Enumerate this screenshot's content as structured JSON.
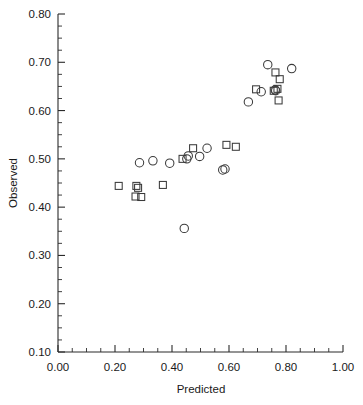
{
  "chart_data": {
    "type": "scatter",
    "title": "",
    "xlabel": "Predicted",
    "ylabel": "Observed",
    "xlim": [
      0.0,
      1.0
    ],
    "ylim": [
      0.1,
      0.8
    ],
    "grid": false,
    "legend": "none",
    "xticks": [
      0.0,
      0.2,
      0.4,
      0.6,
      0.8,
      1.0
    ],
    "xtick_labels": [
      "0.00",
      "0.20",
      "0.40",
      "0.60",
      "0.80",
      "1.00"
    ],
    "yticks": [
      0.1,
      0.2,
      0.3,
      0.4,
      0.5,
      0.6,
      0.7,
      0.8
    ],
    "ytick_labels": [
      "0.10",
      "0.20",
      "0.30",
      "0.40",
      "0.50",
      "0.60",
      "0.70",
      "0.80"
    ],
    "x_minor_tick_step": 0.05,
    "y_minor_tick_step": 0.025,
    "series": [
      {
        "name": "circles",
        "marker": "circle",
        "color": "#3a3a3a",
        "points": [
          [
            0.286,
            0.492
          ],
          [
            0.333,
            0.496
          ],
          [
            0.392,
            0.491
          ],
          [
            0.443,
            0.356
          ],
          [
            0.452,
            0.5
          ],
          [
            0.457,
            0.506
          ],
          [
            0.497,
            0.505
          ],
          [
            0.523,
            0.522
          ],
          [
            0.578,
            0.477
          ],
          [
            0.586,
            0.479
          ],
          [
            0.668,
            0.618
          ],
          [
            0.713,
            0.639
          ],
          [
            0.736,
            0.695
          ],
          [
            0.762,
            0.643
          ],
          [
            0.764,
            0.641
          ],
          [
            0.82,
            0.687
          ]
        ]
      },
      {
        "name": "squares",
        "marker": "square",
        "color": "#3a3a3a",
        "points": [
          [
            0.213,
            0.444
          ],
          [
            0.275,
            0.444
          ],
          [
            0.281,
            0.44
          ],
          [
            0.272,
            0.422
          ],
          [
            0.292,
            0.421
          ],
          [
            0.368,
            0.446
          ],
          [
            0.437,
            0.5
          ],
          [
            0.474,
            0.522
          ],
          [
            0.591,
            0.529
          ],
          [
            0.624,
            0.525
          ],
          [
            0.695,
            0.644
          ],
          [
            0.757,
            0.641
          ],
          [
            0.763,
            0.679
          ],
          [
            0.77,
            0.645
          ],
          [
            0.778,
            0.665
          ],
          [
            0.774,
            0.621
          ]
        ]
      }
    ]
  }
}
